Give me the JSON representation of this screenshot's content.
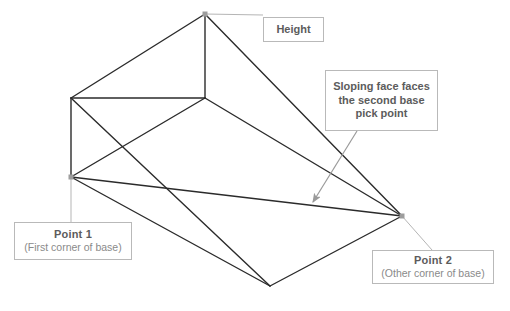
{
  "diagram": {
    "background_color": "#ffffff",
    "edge_color": "#2b2b2b",
    "leader_color": "#b5b5b5",
    "arrow_color": "#9a9a9a",
    "box_border_color": "#b9b9b9",
    "label_color": "#5c5c5c",
    "sub_label_color": "#8a8a8a"
  },
  "callouts": {
    "height": {
      "label": "Height"
    },
    "sloping": {
      "line1": "Sloping face faces",
      "line2": "the second base",
      "line3": "pick point"
    },
    "point1": {
      "title": "Point 1",
      "subtitle": "(First corner of base)"
    },
    "point2": {
      "title": "Point 2",
      "subtitle": "(Other corner of base)"
    }
  },
  "geometry": {
    "vertices": {
      "apex_top": [
        205,
        14
      ],
      "ridge_inner": [
        205,
        98
      ],
      "left_top": [
        71,
        98
      ],
      "point1": [
        71,
        177
      ],
      "point2": [
        402,
        216
      ],
      "base_bottom": [
        270,
        286
      ]
    },
    "edges": [
      [
        [
          205,
          14
        ],
        [
          71,
          98
        ]
      ],
      [
        [
          205,
          14
        ],
        [
          205,
          98
        ]
      ],
      [
        [
          205,
          14
        ],
        [
          402,
          216
        ]
      ],
      [
        [
          71,
          98
        ],
        [
          205,
          98
        ]
      ],
      [
        [
          71,
          98
        ],
        [
          71,
          177
        ]
      ],
      [
        [
          71,
          98
        ],
        [
          270,
          286
        ]
      ],
      [
        [
          205,
          98
        ],
        [
          402,
          216
        ]
      ],
      [
        [
          71,
          177
        ],
        [
          205,
          98
        ]
      ],
      [
        [
          71,
          177
        ],
        [
          402,
          216
        ]
      ],
      [
        [
          71,
          177
        ],
        [
          270,
          286
        ]
      ],
      [
        [
          270,
          286
        ],
        [
          402,
          216
        ]
      ]
    ]
  },
  "leaders": {
    "height_leader": [
      [
        205,
        14
      ],
      [
        263,
        15
      ]
    ],
    "point1_leader": [
      [
        71,
        177
      ],
      [
        71,
        222
      ]
    ],
    "point2_leader": [
      [
        402,
        216
      ],
      [
        432,
        250
      ]
    ],
    "sloping_arrow": [
      [
        357,
        131
      ],
      [
        312,
        203
      ]
    ]
  }
}
